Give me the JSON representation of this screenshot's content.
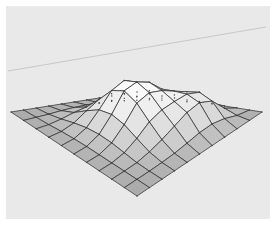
{
  "figure": {
    "title": "",
    "width": 276,
    "height": 225,
    "background_color": "#ffffff",
    "plot_background_color": "#e9e9e9",
    "border_color": "#ffffff",
    "border_width": 6
  },
  "axis_line": {
    "name": "background-axis-line",
    "color": "#c8c8c8",
    "width": 1,
    "x1": 8,
    "y1": 71,
    "x2": 266,
    "y2": 27
  },
  "chart_data": {
    "type": "surface",
    "title": "",
    "subtitle": "",
    "xlabel": "",
    "ylabel": "",
    "zlabel": "",
    "grid": true,
    "legend": "none",
    "colormap": "grayscale",
    "shading": "faceted",
    "mesh_line_color": "#3a3a3a",
    "mesh_line_width": 0.8,
    "face_color_low": "#a9a9a9",
    "face_color_high": "#ffffff",
    "nx": 10,
    "ny": 10,
    "xlim": [
      -3,
      3
    ],
    "ylim": [
      -3,
      3
    ],
    "zlim": [
      0,
      1
    ],
    "projection": {
      "azimuth_deg": -37.5,
      "elevation_deg": 30,
      "corner_left": [
        11,
        112
      ],
      "corner_right": [
        262,
        112
      ],
      "corner_front": [
        137,
        196
      ],
      "corner_back": [
        137,
        92
      ],
      "z_scale_px": 46
    },
    "z": [
      [
        0.0,
        0.0,
        0.0,
        0.0,
        0.0,
        0.0,
        0.0,
        0.0,
        0.0,
        0.0,
        0.0
      ],
      [
        0.0,
        0.01,
        0.02,
        0.04,
        0.05,
        0.05,
        0.04,
        0.03,
        0.02,
        0.01,
        0.0
      ],
      [
        0.0,
        0.02,
        0.07,
        0.14,
        0.19,
        0.2,
        0.17,
        0.11,
        0.05,
        0.02,
        0.0
      ],
      [
        0.0,
        0.04,
        0.14,
        0.32,
        0.48,
        0.52,
        0.44,
        0.28,
        0.13,
        0.04,
        0.0
      ],
      [
        0.0,
        0.05,
        0.19,
        0.48,
        0.8,
        0.92,
        0.78,
        0.5,
        0.24,
        0.07,
        0.0
      ],
      [
        0.0,
        0.05,
        0.2,
        0.52,
        0.92,
        1.0,
        0.88,
        0.62,
        0.38,
        0.12,
        0.0
      ],
      [
        0.0,
        0.04,
        0.17,
        0.44,
        0.78,
        0.88,
        0.8,
        0.66,
        0.52,
        0.18,
        0.0
      ],
      [
        0.0,
        0.03,
        0.11,
        0.28,
        0.5,
        0.62,
        0.66,
        0.68,
        0.58,
        0.2,
        0.0
      ],
      [
        0.0,
        0.02,
        0.05,
        0.13,
        0.24,
        0.38,
        0.52,
        0.58,
        0.46,
        0.15,
        0.0
      ],
      [
        0.0,
        0.01,
        0.02,
        0.04,
        0.07,
        0.12,
        0.18,
        0.2,
        0.15,
        0.05,
        0.0
      ],
      [
        0.0,
        0.0,
        0.0,
        0.0,
        0.0,
        0.0,
        0.0,
        0.0,
        0.0,
        0.0,
        0.0
      ]
    ]
  }
}
